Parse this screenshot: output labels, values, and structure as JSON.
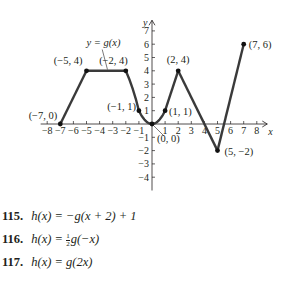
{
  "chart_data": {
    "type": "line",
    "title": "",
    "curve_label": "y = g(x)",
    "xlabel": "x",
    "ylabel": "y",
    "xlim": [
      -8.5,
      8.8
    ],
    "ylim": [
      -5,
      7.8
    ],
    "x_ticks": [
      -8,
      -7,
      -6,
      -5,
      -4,
      -3,
      -2,
      -1,
      1,
      2,
      3,
      4,
      5,
      6,
      7,
      8
    ],
    "x_tick_labels": [
      "−8",
      "−7",
      "−6",
      "−5",
      "−4",
      "−3",
      "−2",
      "−1",
      "1",
      "2",
      "3",
      "4",
      "5",
      "6",
      "7",
      "8"
    ],
    "y_ticks": [
      -4,
      -3,
      -2,
      -1,
      1,
      2,
      3,
      4,
      5,
      6,
      7
    ],
    "y_tick_labels": [
      "−4",
      "−3",
      "−2",
      "−1",
      "1",
      "2",
      "3",
      "4",
      "5",
      "6",
      "7"
    ],
    "grid": false,
    "series": [
      {
        "name": "g(x)",
        "segments": [
          {
            "kind": "linear",
            "points": [
              [
                -7,
                0
              ],
              [
                -5,
                4
              ]
            ]
          },
          {
            "kind": "linear",
            "points": [
              [
                -5,
                4
              ],
              [
                -2,
                4
              ]
            ]
          },
          {
            "kind": "curve",
            "points": [
              [
                -2,
                4
              ],
              [
                -1,
                1
              ]
            ]
          },
          {
            "kind": "parabola",
            "formula": "x^2",
            "domain": [
              -1,
              1
            ]
          },
          {
            "kind": "linear",
            "points": [
              [
                1,
                1
              ],
              [
                2,
                4
              ]
            ]
          },
          {
            "kind": "linear",
            "points": [
              [
                2,
                4
              ],
              [
                5,
                -2
              ]
            ]
          },
          {
            "kind": "linear",
            "points": [
              [
                5,
                -2
              ],
              [
                7,
                6
              ]
            ]
          }
        ]
      }
    ],
    "labeled_points": [
      {
        "x": -7,
        "y": 0,
        "label": "(−7, 0)"
      },
      {
        "x": -5,
        "y": 4,
        "label": "(−5, 4)"
      },
      {
        "x": -2,
        "y": 4,
        "label": "(−2, 4)"
      },
      {
        "x": -1,
        "y": 1,
        "label": "(−1, 1)"
      },
      {
        "x": 0,
        "y": 0,
        "label": "(0, 0)"
      },
      {
        "x": 1,
        "y": 1,
        "label": "(1, 1)"
      },
      {
        "x": 2,
        "y": 4,
        "label": "(2, 4)"
      },
      {
        "x": 5,
        "y": -2,
        "label": "(5, −2)"
      },
      {
        "x": 7,
        "y": 6,
        "label": "(7, 6)"
      }
    ]
  },
  "exercises": [
    {
      "number": "115.",
      "lhs": "h(x)",
      "rhs": "= −g(x + 2) + 1"
    },
    {
      "number": "116.",
      "lhs": "h(x)",
      "rhs_prefix": "= ",
      "frac_num": "1",
      "frac_den": "2",
      "rhs": "g(−x)"
    },
    {
      "number": "117.",
      "lhs": "h(x)",
      "rhs": "= g(2x)"
    }
  ]
}
